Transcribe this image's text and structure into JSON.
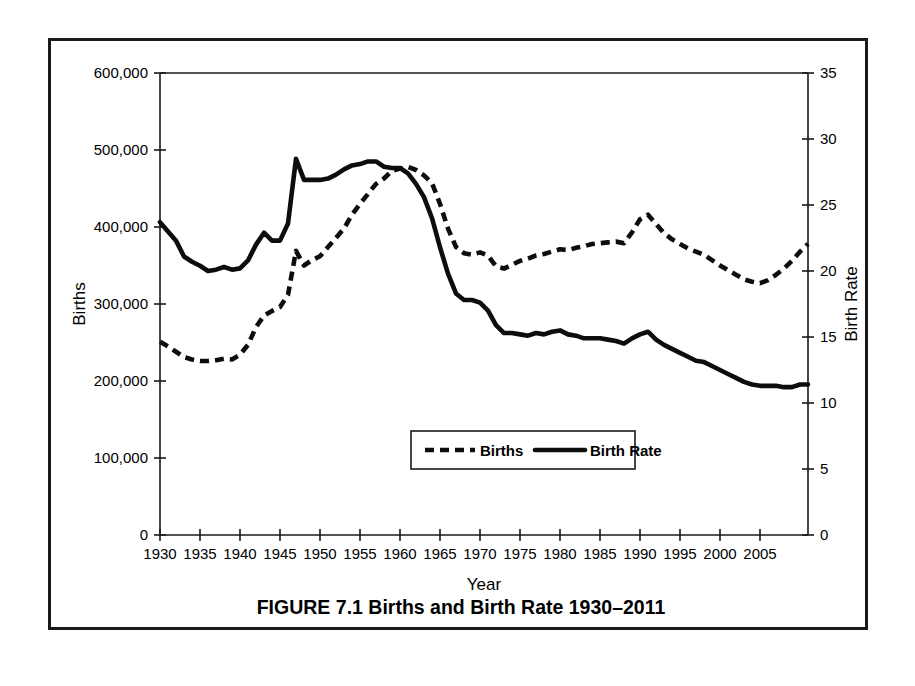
{
  "figure": {
    "caption": "FIGURE 7.1 Births and Birth Rate 1930–2011"
  },
  "chart_data": {
    "type": "line",
    "title": "",
    "xlabel": "Year",
    "ylabel": "Births",
    "y2label": "Birth Rate",
    "xlim": [
      1930,
      2011
    ],
    "ylim": [
      0,
      600000
    ],
    "y2lim": [
      0,
      35
    ],
    "grid": false,
    "legend_position": "inside-bottom-center",
    "xticks": [
      1930,
      1935,
      1940,
      1945,
      1950,
      1955,
      1960,
      1965,
      1970,
      1975,
      1980,
      1985,
      1990,
      1995,
      2000,
      2005
    ],
    "xtick_labels": [
      "1930",
      "1935",
      "1940",
      "1945",
      "1950",
      "1955",
      "1960",
      "1965",
      "1970",
      "1975",
      "1980",
      "1985",
      "1990",
      "1995",
      "2000",
      "2005"
    ],
    "yticks": [
      0,
      100000,
      200000,
      300000,
      400000,
      500000,
      600000
    ],
    "ytick_labels": [
      "0",
      "100,000",
      "200,000",
      "300,000",
      "400,000",
      "500,000",
      "600,000"
    ],
    "y2ticks": [
      0,
      5,
      10,
      15,
      20,
      25,
      30,
      35
    ],
    "y2tick_labels": [
      "0",
      "5",
      "10",
      "15",
      "20",
      "25",
      "30",
      "35"
    ],
    "x": [
      1930,
      1931,
      1932,
      1933,
      1934,
      1935,
      1936,
      1937,
      1938,
      1939,
      1940,
      1941,
      1942,
      1943,
      1944,
      1945,
      1946,
      1947,
      1948,
      1949,
      1950,
      1951,
      1952,
      1953,
      1954,
      1955,
      1956,
      1957,
      1958,
      1959,
      1960,
      1961,
      1962,
      1963,
      1964,
      1965,
      1966,
      1967,
      1968,
      1969,
      1970,
      1971,
      1972,
      1973,
      1974,
      1975,
      1976,
      1977,
      1978,
      1979,
      1980,
      1981,
      1982,
      1983,
      1984,
      1985,
      1986,
      1987,
      1988,
      1989,
      1990,
      1991,
      1992,
      1993,
      1994,
      1995,
      1996,
      1997,
      1998,
      1999,
      2000,
      2001,
      2002,
      2003,
      2004,
      2005,
      2006,
      2007,
      2008,
      2009,
      2010,
      2011
    ],
    "series": [
      {
        "name": "Births",
        "axis": "left",
        "style": "dashed",
        "units": "births",
        "values": [
          251000,
          245000,
          238000,
          231000,
          228000,
          226000,
          226000,
          227000,
          229000,
          228000,
          234000,
          247000,
          270000,
          285000,
          291000,
          296000,
          312000,
          369000,
          350000,
          357000,
          362000,
          374000,
          386000,
          398000,
          416000,
          430000,
          443000,
          456000,
          463000,
          473000,
          476000,
          478000,
          474000,
          467000,
          457000,
          430000,
          398000,
          374000,
          366000,
          364000,
          367000,
          363000,
          349000,
          346000,
          351000,
          356000,
          359000,
          363000,
          365000,
          368000,
          371000,
          370000,
          373000,
          375000,
          378000,
          379000,
          380000,
          381000,
          379000,
          393000,
          410000,
          416000,
          404000,
          392000,
          384000,
          378000,
          372000,
          368000,
          364000,
          357000,
          350000,
          344000,
          338000,
          332000,
          329000,
          327000,
          331000,
          338000,
          346000,
          356000,
          368000,
          378000
        ]
      },
      {
        "name": "Birth Rate",
        "axis": "right",
        "style": "solid",
        "units": "births per 1,000 population",
        "values": [
          23.7,
          23.0,
          22.3,
          21.1,
          20.7,
          20.4,
          20.0,
          20.1,
          20.3,
          20.1,
          20.2,
          20.8,
          22.0,
          22.9,
          22.3,
          22.3,
          23.6,
          28.5,
          26.9,
          26.9,
          26.9,
          27.0,
          27.3,
          27.7,
          28.0,
          28.1,
          28.3,
          28.3,
          27.9,
          27.8,
          27.8,
          27.4,
          26.6,
          25.6,
          24.0,
          21.8,
          19.8,
          18.3,
          17.8,
          17.8,
          17.6,
          17.0,
          15.9,
          15.3,
          15.3,
          15.2,
          15.1,
          15.3,
          15.2,
          15.4,
          15.5,
          15.2,
          15.1,
          14.9,
          14.9,
          14.9,
          14.8,
          14.7,
          14.5,
          14.9,
          15.2,
          15.4,
          14.8,
          14.4,
          14.1,
          13.8,
          13.5,
          13.2,
          13.1,
          12.8,
          12.5,
          12.2,
          11.9,
          11.6,
          11.4,
          11.3,
          11.3,
          11.3,
          11.2,
          11.2,
          11.4,
          11.4
        ]
      }
    ],
    "legend": [
      {
        "label": "Births",
        "style": "dashed"
      },
      {
        "label": "Birth Rate",
        "style": "solid"
      }
    ]
  }
}
